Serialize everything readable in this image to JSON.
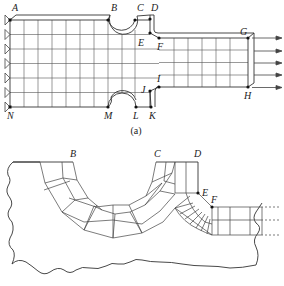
{
  "figure_a": {
    "caption": "(a)",
    "labels": {
      "A": "A",
      "B": "B",
      "C": "C",
      "D": "D",
      "E": "E",
      "F": "F",
      "G": "G",
      "H": "H",
      "I": "I",
      "J": "J",
      "K": "K",
      "L": "L",
      "M": "M",
      "N": "N"
    },
    "supports": 7,
    "load_arrows": 5
  },
  "figure_b": {
    "labels": {
      "B": "B",
      "C": "C",
      "D": "D",
      "E": "E",
      "F": "F"
    }
  },
  "colors": {
    "line": "#333333",
    "background": "#ffffff"
  }
}
